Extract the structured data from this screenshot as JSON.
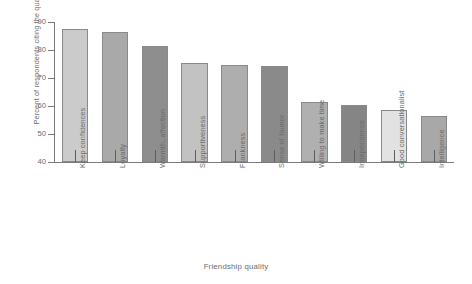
{
  "chart_data": {
    "type": "bar",
    "title": "",
    "xlabel": "Friendship quality",
    "ylabel": "Percent of respondents citing the quality",
    "ylim": [
      40,
      90
    ],
    "yticks": [
      40,
      50,
      60,
      70,
      80,
      90
    ],
    "grid": false,
    "legend": false,
    "categories": [
      "Keep confidences",
      "Loyalty",
      "Warmth, affection",
      "Supportiveness",
      "Frankness",
      "Sense of humor",
      "Willing to make time",
      "Independence",
      "Good conversationalist",
      "Intelligence"
    ],
    "values": [
      87.5,
      86.5,
      81.5,
      75.5,
      74.8,
      74.2,
      61.5,
      60.5,
      58.5,
      56.5
    ],
    "bar_colors": [
      "#cbcbcb",
      "#a9a9a9",
      "#8e8e8e",
      "#c2c2c2",
      "#aeaeae",
      "#8a8a8a",
      "#b0b0b0",
      "#858585",
      "#e2e2e2",
      "#a8a8a8"
    ]
  },
  "axis": {
    "y_tick_labels": [
      "40",
      "50",
      "60",
      "70",
      "80",
      "90"
    ]
  }
}
